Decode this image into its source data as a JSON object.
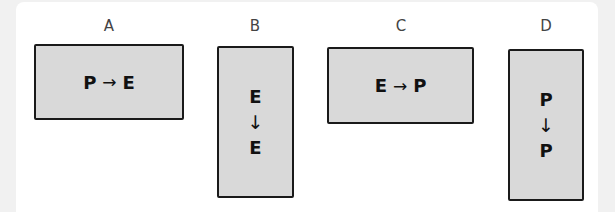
{
  "panels": [
    {
      "label": "A",
      "from": "P",
      "to": "E",
      "arrow": "→",
      "orientation": "horizontal"
    },
    {
      "label": "B",
      "from": "E",
      "to": "E",
      "arrow": "↓",
      "orientation": "vertical"
    },
    {
      "label": "C",
      "from": "E",
      "to": "P",
      "arrow": "→",
      "orientation": "horizontal"
    },
    {
      "label": "D",
      "from": "P",
      "to": "P",
      "arrow": "↓",
      "orientation": "vertical"
    }
  ],
  "colors": {
    "box_fill": "#d9d9d9",
    "box_border": "#1a1a1a",
    "background": "#ffffff",
    "outer": "#f1f1f1"
  }
}
